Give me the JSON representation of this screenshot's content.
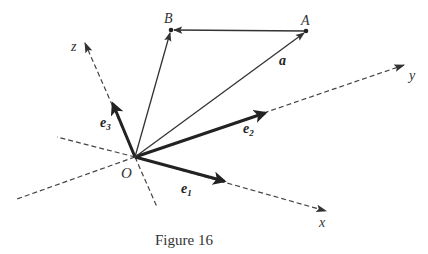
{
  "figure": {
    "caption": "Figure 16",
    "origin_label": "O",
    "points": {
      "A": {
        "label": "A",
        "x": 306,
        "y": 31
      },
      "B": {
        "label": "B",
        "x": 171,
        "y": 30
      }
    },
    "axes": {
      "x": {
        "label": "x"
      },
      "y": {
        "label": "y"
      },
      "z": {
        "label": "z"
      }
    },
    "basis_vectors": {
      "e1": {
        "base": "e",
        "sub": "1"
      },
      "e2": {
        "base": "e",
        "sub": "2"
      },
      "e3": {
        "base": "e",
        "sub": "3"
      }
    },
    "vector_a": {
      "label": "a"
    },
    "colors": {
      "stroke": "#333333",
      "background": "#ffffff"
    }
  }
}
